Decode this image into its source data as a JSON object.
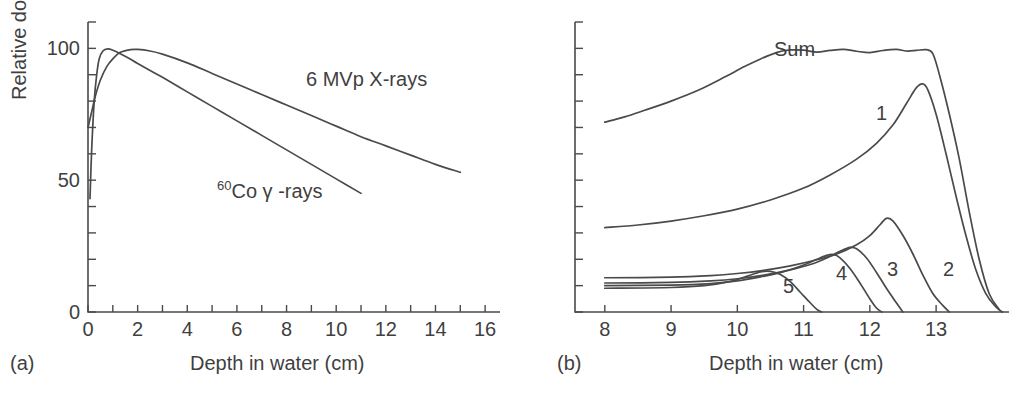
{
  "figure": {
    "background": "#ffffff",
    "line_color": "#4a4a4a",
    "text_color": "#3f3f3f"
  },
  "panel_a": {
    "label": "(a)",
    "xlabel": "Depth in water (cm)",
    "ylabel": "Relative dose (%)",
    "y_ticklabels": [
      "0",
      "50",
      "100"
    ],
    "x_ticklabels": [
      "0",
      "2",
      "4",
      "6",
      "8",
      "10",
      "12",
      "14",
      "16"
    ],
    "curve_labels": {
      "xrays": "6 MVp X-rays",
      "cobalt_sup": "60",
      "cobalt_main": "Co γ -rays"
    }
  },
  "panel_b": {
    "label": "(b)",
    "xlabel": "Depth in water (cm)",
    "x_ticklabels": [
      "8",
      "9",
      "10",
      "11",
      "12",
      "13"
    ],
    "curve_labels": [
      "Sum",
      "1",
      "2",
      "3",
      "4",
      "5"
    ]
  },
  "chart_data": [
    {
      "type": "line",
      "title": "Relative depth dose for megavoltage photon beams",
      "panel": "(a)",
      "xlabel": "Depth in water (cm)",
      "ylabel": "Relative dose (%)",
      "xlim": [
        0,
        16.6
      ],
      "ylim": [
        0,
        110
      ],
      "xticks": [
        0,
        1,
        2,
        3,
        4,
        5,
        6,
        7,
        8,
        9,
        10,
        11,
        12,
        13,
        14,
        15,
        16
      ],
      "xticklabels_at": [
        0,
        2,
        4,
        6,
        8,
        10,
        12,
        14,
        16
      ],
      "yticks": [
        0,
        10,
        20,
        30,
        40,
        50,
        60,
        70,
        80,
        90,
        100,
        110
      ],
      "yticklabels_at": [
        0,
        50,
        100
      ],
      "grid": false,
      "legend": "inline-annotations",
      "series": [
        {
          "name": "6 MVp X-rays",
          "label_position": {
            "x": 7.4,
            "y": 84
          },
          "points": [
            [
              0.0,
              70
            ],
            [
              0.15,
              76
            ],
            [
              0.3,
              82
            ],
            [
              0.5,
              88
            ],
            [
              0.75,
              93
            ],
            [
              1.0,
              96
            ],
            [
              1.3,
              98.5
            ],
            [
              1.7,
              99.5
            ],
            [
              2.0,
              99.6
            ],
            [
              2.5,
              99
            ],
            [
              3.0,
              97.8
            ],
            [
              4.0,
              94.5
            ],
            [
              5.0,
              90.5
            ],
            [
              6.0,
              86.5
            ],
            [
              7.0,
              82.5
            ],
            [
              8.0,
              78.5
            ],
            [
              9.0,
              74.5
            ],
            [
              10.0,
              70.5
            ],
            [
              11.0,
              66.5
            ],
            [
              12.0,
              63
            ],
            [
              13.0,
              59.5
            ],
            [
              14.0,
              56
            ],
            [
              15.0,
              53
            ]
          ]
        },
        {
          "name": "60Co gamma-rays",
          "label_position": {
            "x": 4.6,
            "y": 40
          },
          "points": [
            [
              0.08,
              43
            ],
            [
              0.15,
              62
            ],
            [
              0.25,
              80
            ],
            [
              0.35,
              90
            ],
            [
              0.45,
              96
            ],
            [
              0.6,
              99
            ],
            [
              0.8,
              99.8
            ],
            [
              1.0,
              99.3
            ],
            [
              1.3,
              98
            ],
            [
              1.7,
              96
            ],
            [
              2.0,
              94.3
            ],
            [
              3.0,
              89
            ],
            [
              4.0,
              83.5
            ],
            [
              5.0,
              78
            ],
            [
              6.0,
              72.5
            ],
            [
              7.0,
              67
            ],
            [
              8.0,
              61.5
            ],
            [
              9.0,
              56
            ],
            [
              10.0,
              50.5
            ],
            [
              11.0,
              45
            ]
          ]
        }
      ]
    },
    {
      "type": "line",
      "title": "Spread-out Bragg peak formed by summing weighted pristine peaks",
      "panel": "(b)",
      "xlabel": "Depth in water (cm)",
      "ylabel": "",
      "xlim": [
        7.55,
        14.1
      ],
      "ylim": [
        0,
        110
      ],
      "xticks": [
        8,
        9,
        10,
        11,
        12,
        13
      ],
      "xticklabels_at": [
        8,
        9,
        10,
        11,
        12,
        13
      ],
      "yticks": [
        0,
        10,
        20,
        30,
        40,
        50,
        60,
        70,
        80,
        90,
        100,
        110
      ],
      "yticklabels_at": [],
      "grid": false,
      "legend": "inline-annotations",
      "series": [
        {
          "name": "Sum",
          "label_position": {
            "x": 10.55,
            "y": 88
          },
          "points": [
            [
              8.0,
              72
            ],
            [
              8.3,
              74
            ],
            [
              8.6,
              76.5
            ],
            [
              9.0,
              80
            ],
            [
              9.4,
              84
            ],
            [
              9.8,
              89
            ],
            [
              10.1,
              93
            ],
            [
              10.35,
              96
            ],
            [
              10.6,
              98.5
            ],
            [
              10.8,
              99.4
            ],
            [
              11.0,
              99.3
            ],
            [
              11.2,
              98.6
            ],
            [
              11.4,
              99.2
            ],
            [
              11.6,
              99.6
            ],
            [
              11.8,
              98.9
            ],
            [
              12.0,
              98.4
            ],
            [
              12.2,
              99.2
            ],
            [
              12.4,
              99.6
            ],
            [
              12.55,
              99.0
            ],
            [
              12.7,
              99.2
            ],
            [
              12.85,
              99.5
            ],
            [
              12.95,
              98
            ],
            [
              13.05,
              90
            ],
            [
              13.2,
              75
            ],
            [
              13.35,
              58
            ],
            [
              13.5,
              38
            ],
            [
              13.65,
              20
            ],
            [
              13.8,
              7
            ],
            [
              13.95,
              1
            ]
          ]
        },
        {
          "name": "1",
          "label_position": {
            "x": 12.35,
            "y": 66
          },
          "points": [
            [
              8.0,
              32
            ],
            [
              8.5,
              33
            ],
            [
              9.0,
              34.5
            ],
            [
              9.5,
              36.5
            ],
            [
              10.0,
              39
            ],
            [
              10.5,
              42.5
            ],
            [
              11.0,
              47
            ],
            [
              11.4,
              52
            ],
            [
              11.8,
              58
            ],
            [
              12.1,
              64
            ],
            [
              12.35,
              71
            ],
            [
              12.55,
              79
            ],
            [
              12.7,
              85
            ],
            [
              12.8,
              86.5
            ],
            [
              12.88,
              84
            ],
            [
              13.0,
              75
            ],
            [
              13.15,
              60
            ],
            [
              13.3,
              44
            ],
            [
              13.45,
              29
            ],
            [
              13.6,
              16
            ],
            [
              13.75,
              7
            ],
            [
              13.9,
              2
            ],
            [
              14.0,
              0
            ]
          ]
        },
        {
          "name": "2",
          "label_position": {
            "x": 13.2,
            "y": 16
          },
          "points": [
            [
              8.0,
              13
            ],
            [
              9.0,
              13.2
            ],
            [
              9.6,
              13.8
            ],
            [
              10.0,
              14.6
            ],
            [
              10.4,
              15.8
            ],
            [
              10.8,
              17.5
            ],
            [
              11.2,
              19.8
            ],
            [
              11.5,
              22
            ],
            [
              11.8,
              25.5
            ],
            [
              12.0,
              29
            ],
            [
              12.15,
              33
            ],
            [
              12.25,
              35.5
            ],
            [
              12.35,
              34.5
            ],
            [
              12.5,
              29
            ],
            [
              12.65,
              22
            ],
            [
              12.8,
              14
            ],
            [
              12.95,
              7
            ],
            [
              13.1,
              2.5
            ],
            [
              13.2,
              0
            ]
          ]
        },
        {
          "name": "3",
          "label_position": {
            "x": 12.55,
            "y": 16
          },
          "points": [
            [
              8.0,
              11
            ],
            [
              9.0,
              11.2
            ],
            [
              9.6,
              11.8
            ],
            [
              10.0,
              12.6
            ],
            [
              10.4,
              14
            ],
            [
              10.8,
              16
            ],
            [
              11.1,
              18
            ],
            [
              11.35,
              20.5
            ],
            [
              11.55,
              23
            ],
            [
              11.7,
              24.5
            ],
            [
              11.8,
              24
            ],
            [
              11.95,
              20.5
            ],
            [
              12.1,
              15
            ],
            [
              12.25,
              9
            ],
            [
              12.4,
              3.5
            ],
            [
              12.5,
              0
            ]
          ]
        },
        {
          "name": "4",
          "label_position": {
            "x": 12.0,
            "y": 15
          },
          "points": [
            [
              8.0,
              10
            ],
            [
              9.0,
              10.2
            ],
            [
              9.6,
              10.8
            ],
            [
              10.0,
              11.8
            ],
            [
              10.35,
              13.3
            ],
            [
              10.7,
              15.3
            ],
            [
              11.0,
              17.8
            ],
            [
              11.2,
              20
            ],
            [
              11.35,
              21.5
            ],
            [
              11.45,
              21.8
            ],
            [
              11.55,
              20.5
            ],
            [
              11.7,
              16.5
            ],
            [
              11.85,
              11
            ],
            [
              12.0,
              5
            ],
            [
              12.1,
              1.5
            ],
            [
              12.18,
              0
            ]
          ]
        },
        {
          "name": "5",
          "label_position": {
            "x": 11.35,
            "y": 10
          },
          "points": [
            [
              8.0,
              9
            ],
            [
              9.0,
              9.3
            ],
            [
              9.5,
              10
            ],
            [
              9.9,
              11.6
            ],
            [
              10.15,
              13.6
            ],
            [
              10.35,
              15.2
            ],
            [
              10.5,
              15.4
            ],
            [
              10.65,
              14.2
            ],
            [
              10.8,
              11.5
            ],
            [
              10.95,
              7.5
            ],
            [
              11.1,
              3.5
            ],
            [
              11.2,
              1
            ],
            [
              11.27,
              0
            ]
          ]
        }
      ]
    }
  ]
}
